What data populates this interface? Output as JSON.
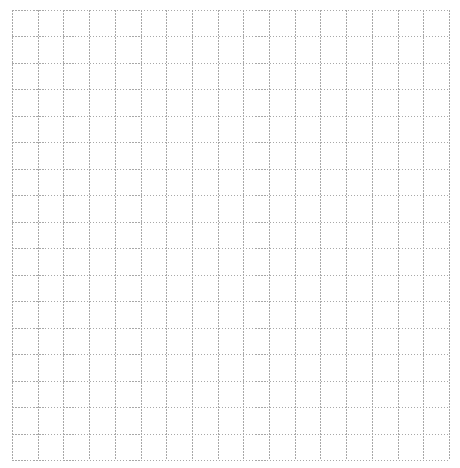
{
  "grid": {
    "left": 12,
    "top": 10,
    "right": 449,
    "bottom": 460,
    "columns": 17,
    "rows": 17,
    "line_color": "#a8a8a8",
    "dash": "1.5,1.5",
    "background": "#ffffff"
  },
  "highlights": [
    {
      "y": 142,
      "x1": 12,
      "x2": 88,
      "fade_start": 62,
      "color": "#6a6a6a"
    },
    {
      "y": 142,
      "x1": 220,
      "x2": 297,
      "fade_start": 232,
      "color": "#6a6a6a",
      "fade_in": true
    }
  ]
}
